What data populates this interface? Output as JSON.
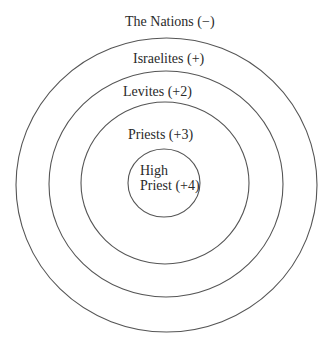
{
  "diagram": {
    "type": "concentric-circles",
    "stroke_color": "#555555",
    "rings": [
      {
        "id": "nations",
        "label": "The Nations (−)",
        "cx": 166.5,
        "cy": 185,
        "rx": 150.5,
        "ry": 147
      },
      {
        "id": "israelites",
        "label": "Israelites (+)",
        "cx": 166,
        "cy": 184,
        "rx": 117,
        "ry": 113
      },
      {
        "id": "levites",
        "label": "Levites (+2)",
        "cx": 165,
        "cy": 183,
        "rx": 84,
        "ry": 81
      },
      {
        "id": "priests",
        "label": "Priests (+3)",
        "cx": 164,
        "cy": 183,
        "rx": 36,
        "ry": 34
      }
    ],
    "labels": {
      "nations": "The Nations (−)",
      "israelites": "Israelites (+)",
      "levites": "Levites (+2)",
      "priests": "Priests (+3)",
      "high_priest_line1": "High",
      "high_priest_line2": "Priest (+4)"
    }
  }
}
